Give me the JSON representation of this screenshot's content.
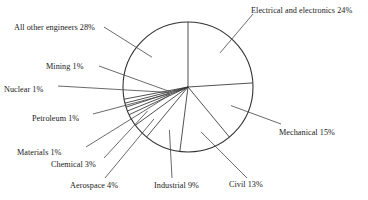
{
  "chart_data": {
    "type": "pie",
    "title": "",
    "subtitle": "",
    "xlabel": "",
    "ylabel": "",
    "legend_position": "none",
    "grid": false,
    "unit": "%",
    "start_angle_deg": 0,
    "direction": "clockwise",
    "total": 100,
    "categories": [
      "Electrical and electronics",
      "Mechanical",
      "Civil",
      "Industrial",
      "Aerospace",
      "Chemical",
      "Materials",
      "Petroleum",
      "Nuclear",
      "Mining",
      "All other engineers"
    ],
    "values": [
      24,
      15,
      13,
      9,
      4,
      3,
      1,
      1,
      1,
      1,
      28
    ],
    "labels": [
      "Electrical and electronics 24%",
      "Mechanical 15%",
      "Civil 13%",
      "Industrial 9%",
      "Aerospace 4%",
      "Chemical 3%",
      "Materials 1%",
      "Petroleum 1%",
      "Nuclear 1%",
      "Mining 1%",
      "All other engineers 28%"
    ],
    "slice_fill": "#ffffff",
    "stroke_color": "#333333"
  },
  "chart": {
    "center_x": 188,
    "center_y": 87,
    "radius": 65,
    "labels": {
      "electrical": "Electrical and electronics 24%",
      "mechanical": "Mechanical 15%",
      "civil": "Civil 13%",
      "industrial": "Industrial 9%",
      "aerospace": "Aerospace 4%",
      "chemical": "Chemical 3%",
      "materials": "Materials 1%",
      "petroleum": "Petroleum 1%",
      "nuclear": "Nuclear 1%",
      "mining": "Mining 1%",
      "all_other": "All other engineers 28%"
    }
  }
}
